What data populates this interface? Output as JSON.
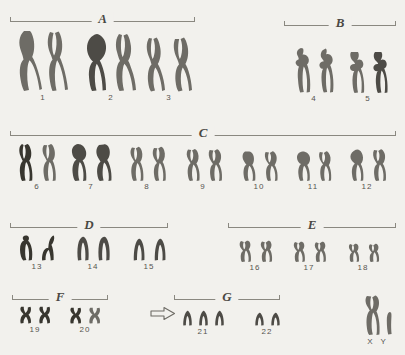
{
  "figure": {
    "background_color": "#f2f1ed",
    "chromosome_color": "#6e6c66",
    "total_rows": 5
  },
  "groups": [
    {
      "letter": "A",
      "name": "group-a",
      "pairs": [
        "1",
        "2",
        "3"
      ]
    },
    {
      "letter": "B",
      "name": "group-b",
      "pairs": [
        "4",
        "5"
      ]
    },
    {
      "letter": "C",
      "name": "group-c",
      "pairs": [
        "6",
        "7",
        "8",
        "9",
        "10",
        "11",
        "12"
      ]
    },
    {
      "letter": "D",
      "name": "group-d",
      "pairs": [
        "13",
        "14",
        "15"
      ]
    },
    {
      "letter": "E",
      "name": "group-e",
      "pairs": [
        "16",
        "17",
        "18"
      ]
    },
    {
      "letter": "F",
      "name": "group-f",
      "pairs": [
        "19",
        "20"
      ]
    },
    {
      "letter": "G",
      "name": "group-g",
      "pairs": [
        "21",
        "22"
      ]
    }
  ],
  "labels": {
    "g_a": "A",
    "g_b": "B",
    "g_c": "C",
    "g_d": "D",
    "g_e": "E",
    "g_f": "F",
    "g_g": "G",
    "n1": "1",
    "n2": "2",
    "n3": "3",
    "n4": "4",
    "n5": "5",
    "n6": "6",
    "n7": "7",
    "n8": "8",
    "n9": "9",
    "n10": "10",
    "n11": "11",
    "n12": "12",
    "n13": "13",
    "n14": "14",
    "n15": "15",
    "n16": "16",
    "n17": "17",
    "n18": "18",
    "n19": "19",
    "n20": "20",
    "n21": "21",
    "n22": "22",
    "sex": "X Y"
  },
  "annotation": {
    "arrow_icon": "arrow-right-outline",
    "points_to": "21",
    "finding": "trisomy 21"
  },
  "counts": {
    "pair_21_chromosomes": 3,
    "standard_pair_chromosomes": 2
  }
}
